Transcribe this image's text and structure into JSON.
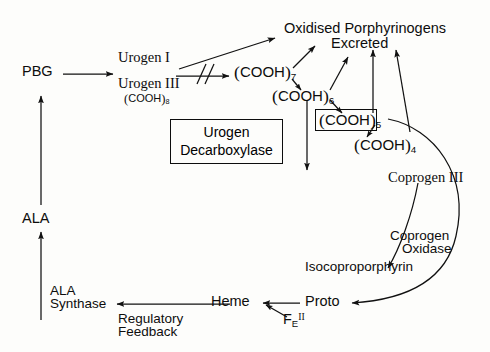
{
  "diagram": {
    "line_color": "#111111",
    "background": "#fdfdfb"
  },
  "nodes": {
    "pbg": "PBG",
    "ala": "ALA",
    "ala_synthase_line1": "ALA",
    "ala_synthase_line2": "Synthase",
    "urogen_i": "Urogen I",
    "urogen_iii": "Urogen III",
    "oxidised_line1": "Oxidised  Porphyrinogens",
    "oxidised_line2": "Excreted",
    "coprogen_iii": "Coprogen III",
    "coprogen_oxidase_line1": "Coprogen",
    "coprogen_oxidase_line2": "Oxidase",
    "isocoproporphyrin": "Isocoproporphyrin",
    "heme": "Heme",
    "proto": "Proto",
    "regulatory_line1": "Regulatory",
    "regulatory_line2": "Feedback"
  },
  "enzyme_box": {
    "line1": "Urogen",
    "line2": "Decarboxylase"
  },
  "iron": {
    "element": "F",
    "subscript": "E",
    "valence": "II"
  },
  "cooh_species": [
    {
      "id": "cooh8",
      "label": "COOH",
      "count": "8",
      "note": "Urogen III substituent"
    },
    {
      "id": "cooh7",
      "label": "COOH",
      "count": "7"
    },
    {
      "id": "cooh6",
      "label": "COOH",
      "count": "6"
    },
    {
      "id": "cooh5",
      "label": "COOH",
      "count": "5",
      "boxed": true
    },
    {
      "id": "cooh4",
      "label": "COOH",
      "count": "4"
    }
  ],
  "markers": {
    "blocked_pathway": "//"
  }
}
